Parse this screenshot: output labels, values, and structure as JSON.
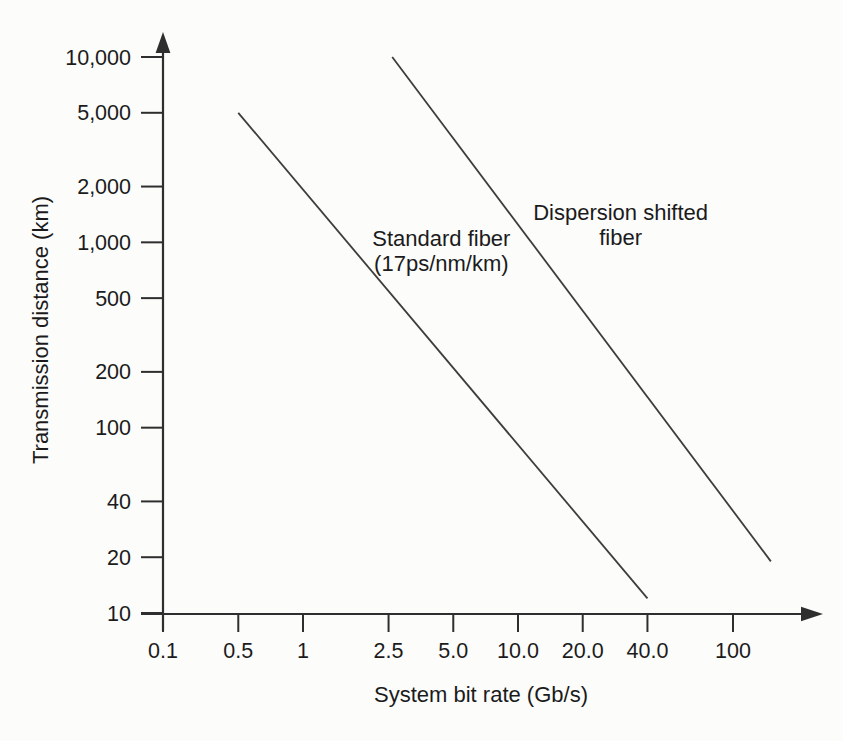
{
  "figure": {
    "background": "#fcfcfb",
    "ink_color": "#2e2e2e",
    "series_line_color": "#3d3d3d",
    "text_color": "#1b1b1b"
  },
  "chart_data": {
    "type": "line",
    "title": "",
    "xlabel": "System bit rate (Gb/s)",
    "ylabel": "Transmission distance (km)",
    "x_scale": "log",
    "y_scale": "log",
    "xlim": [
      0.1,
      200
    ],
    "ylim": [
      10,
      10000
    ],
    "grid": false,
    "legend_position": "inline-annotations",
    "x_ticks": [
      {
        "value": 0.1,
        "label": "0.1"
      },
      {
        "value": 0.5,
        "label": "0.5"
      },
      {
        "value": 1,
        "label": "1"
      },
      {
        "value": 2.5,
        "label": "2.5"
      },
      {
        "value": 5,
        "label": "5.0"
      },
      {
        "value": 10,
        "label": "10.0"
      },
      {
        "value": 20,
        "label": "20.0"
      },
      {
        "value": 40,
        "label": "40.0"
      },
      {
        "value": 100,
        "label": "100"
      }
    ],
    "y_ticks": [
      {
        "value": 10000,
        "label": "10,000"
      },
      {
        "value": 5000,
        "label": "5,000"
      },
      {
        "value": 2000,
        "label": "2,000"
      },
      {
        "value": 1000,
        "label": "1,000"
      },
      {
        "value": 500,
        "label": "500"
      },
      {
        "value": 200,
        "label": "200"
      },
      {
        "value": 100,
        "label": "100"
      },
      {
        "value": 40,
        "label": "40"
      },
      {
        "value": 20,
        "label": "20"
      },
      {
        "value": 10,
        "label": "10"
      }
    ],
    "series": [
      {
        "name": "Standard fiber (17ps/nm/km)",
        "label_lines": [
          "Standard fiber",
          "(17ps/nm/km)"
        ],
        "label_anchor": [
          4.4,
          1050
        ],
        "points": [
          [
            0.5,
            5000
          ],
          [
            40,
            12
          ]
        ]
      },
      {
        "name": "Dispersion shifted fiber",
        "label_lines": [
          "Dispersion shifted",
          "fiber"
        ],
        "label_anchor": [
          30,
          1450
        ],
        "points": [
          [
            2.6,
            10000
          ],
          [
            150,
            19
          ]
        ]
      }
    ]
  }
}
